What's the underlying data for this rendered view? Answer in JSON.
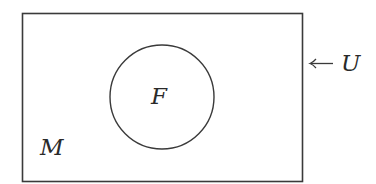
{
  "diagram": {
    "type": "venn-diagram",
    "stroke_color": "#3a3a3a",
    "background": "#ffffff",
    "universe": {
      "label": "U",
      "pointer_glyph": "←",
      "rect": {
        "x": 22,
        "y": 13,
        "width": 280,
        "height": 168
      }
    },
    "sets": [
      {
        "label": "F",
        "shape": "circle",
        "cx": 162,
        "cy": 97,
        "r": 52
      }
    ],
    "region_labels": [
      {
        "label": "M",
        "region": "universe-outside-F"
      }
    ]
  }
}
